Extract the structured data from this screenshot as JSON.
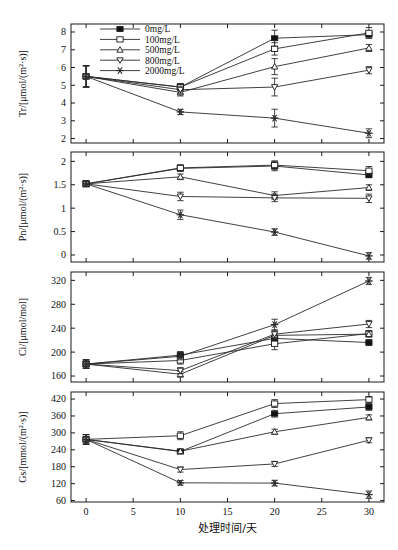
{
  "figure": {
    "xlabel": "处理时间/天",
    "x_ticks": [
      0,
      5,
      10,
      15,
      20,
      25,
      30
    ],
    "x": [
      0,
      10,
      20,
      30
    ],
    "xlim": [
      -1.6,
      31.6
    ],
    "legend": {
      "position": "top-left-panel-1",
      "entries": [
        {
          "label": "0mg/L",
          "marker": "filled-square"
        },
        {
          "label": "100mg/L",
          "marker": "open-square"
        },
        {
          "label": "500mg/L",
          "marker": "open-triangle-up"
        },
        {
          "label": "800mg/L",
          "marker": "open-triangle-down"
        },
        {
          "label": "2000mg/L",
          "marker": "asterisk"
        }
      ]
    }
  },
  "chart_data": [
    {
      "type": "line",
      "panel": 1,
      "title": "",
      "xlabel": "",
      "ylabel": "Tr/[μmol/(m²·s)]",
      "x": [
        0,
        10,
        20,
        30
      ],
      "xlim": [
        -1.6,
        31.6
      ],
      "ylim": [
        1.75,
        8.45
      ],
      "yticks": [
        2,
        3,
        4,
        5,
        6,
        7,
        8
      ],
      "grid": false,
      "series": [
        {
          "name": "0mg/L",
          "marker": "filled-square",
          "values": [
            5.5,
            4.9,
            7.65,
            7.85
          ],
          "errors": [
            0.6,
            0.2,
            0.45,
            0.2
          ]
        },
        {
          "name": "100mg/L",
          "marker": "open-square",
          "values": [
            5.5,
            4.9,
            7.05,
            7.95
          ],
          "errors": [
            0.6,
            0.2,
            0.35,
            0.3
          ]
        },
        {
          "name": "500mg/L",
          "marker": "open-triangle-up",
          "values": [
            5.5,
            4.6,
            6.05,
            7.1
          ],
          "errors": [
            0.6,
            0.2,
            0.45,
            0.2
          ]
        },
        {
          "name": "800mg/L",
          "marker": "open-triangle-down",
          "values": [
            5.5,
            4.75,
            4.9,
            5.85
          ],
          "errors": [
            0.6,
            0.2,
            0.5,
            0.2
          ]
        },
        {
          "name": "2000mg/L",
          "marker": "asterisk",
          "values": [
            5.5,
            3.5,
            3.15,
            2.3
          ],
          "errors": [
            0.6,
            0.15,
            0.5,
            0.25
          ]
        }
      ]
    },
    {
      "type": "line",
      "panel": 2,
      "title": "",
      "xlabel": "",
      "ylabel": "Pn/[μmol/(m²·s)]",
      "x": [
        0,
        10,
        20,
        30
      ],
      "xlim": [
        -1.6,
        31.6
      ],
      "ylim": [
        -0.15,
        2.2
      ],
      "yticks": [
        0.0,
        0.5,
        1.0,
        1.5,
        2.0
      ],
      "grid": false,
      "series": [
        {
          "name": "0mg/L",
          "marker": "filled-square",
          "values": [
            1.52,
            1.85,
            1.9,
            1.71
          ],
          "errors": [
            0.06,
            0.06,
            0.1,
            0.06
          ]
        },
        {
          "name": "100mg/L",
          "marker": "open-square",
          "values": [
            1.52,
            1.86,
            1.92,
            1.8
          ],
          "errors": [
            0.06,
            0.07,
            0.09,
            0.09
          ]
        },
        {
          "name": "500mg/L",
          "marker": "open-triangle-up",
          "values": [
            1.52,
            1.67,
            1.27,
            1.44
          ],
          "errors": [
            0.06,
            0.06,
            0.08,
            0.06
          ]
        },
        {
          "name": "800mg/L",
          "marker": "open-triangle-down",
          "values": [
            1.52,
            1.25,
            1.22,
            1.21
          ],
          "errors": [
            0.06,
            0.09,
            0.08,
            0.09
          ]
        },
        {
          "name": "2000mg/L",
          "marker": "asterisk",
          "values": [
            1.52,
            0.86,
            0.49,
            -0.02
          ],
          "errors": [
            0.06,
            0.1,
            0.07,
            0.07
          ]
        }
      ]
    },
    {
      "type": "line",
      "panel": 3,
      "title": "",
      "xlabel": "",
      "ylabel": "Ci/[μmol/mol]",
      "x": [
        0,
        10,
        20,
        30
      ],
      "xlim": [
        -1.6,
        31.6
      ],
      "ylim": [
        150,
        334
      ],
      "yticks": [
        160,
        200,
        240,
        280,
        320
      ],
      "grid": false,
      "series": [
        {
          "name": "0mg/L",
          "marker": "filled-square",
          "values": [
            180,
            195,
            223,
            216
          ],
          "errors": [
            7,
            6,
            7,
            5
          ]
        },
        {
          "name": "100mg/L",
          "marker": "open-square",
          "values": [
            180,
            186,
            214,
            231
          ],
          "errors": [
            7,
            6,
            10,
            5
          ]
        },
        {
          "name": "500mg/L",
          "marker": "open-triangle-up",
          "values": [
            180,
            163,
            228,
            230
          ],
          "errors": [
            7,
            5,
            7,
            5
          ]
        },
        {
          "name": "800mg/L",
          "marker": "open-triangle-down",
          "values": [
            180,
            169,
            230,
            247
          ],
          "errors": [
            7,
            5,
            7,
            6
          ]
        },
        {
          "name": "2000mg/L",
          "marker": "asterisk",
          "values": [
            180,
            193,
            246,
            319
          ],
          "errors": [
            7,
            6,
            9,
            6
          ]
        }
      ]
    },
    {
      "type": "line",
      "panel": 4,
      "title": "",
      "xlabel": "处理时间/天",
      "ylabel": "Gs/[mmol/(m²·s)]",
      "x": [
        0,
        10,
        20,
        30
      ],
      "xlim": [
        -1.6,
        31.6
      ],
      "ylim": [
        55,
        445
      ],
      "yticks": [
        60,
        120,
        180,
        240,
        300,
        360,
        420
      ],
      "grid": false,
      "series": [
        {
          "name": "0mg/L",
          "marker": "filled-square",
          "values": [
            277,
            234,
            368,
            392
          ],
          "errors": [
            17,
            8,
            12,
            12
          ]
        },
        {
          "name": "100mg/L",
          "marker": "open-square",
          "values": [
            277,
            290,
            404,
            418
          ],
          "errors": [
            17,
            14,
            14,
            11
          ]
        },
        {
          "name": "500mg/L",
          "marker": "open-triangle-up",
          "values": [
            277,
            235,
            304,
            355
          ],
          "errors": [
            17,
            8,
            9,
            9
          ]
        },
        {
          "name": "800mg/L",
          "marker": "open-triangle-down",
          "values": [
            277,
            170,
            190,
            274
          ],
          "errors": [
            17,
            9,
            9,
            9
          ]
        },
        {
          "name": "2000mg/L",
          "marker": "asterisk",
          "values": [
            277,
            123,
            122,
            81
          ],
          "errors": [
            17,
            8,
            10,
            13
          ]
        }
      ]
    }
  ]
}
